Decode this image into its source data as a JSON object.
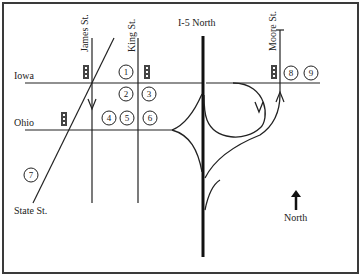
{
  "map": {
    "title": "Street map with I-5 North interchange",
    "streets": {
      "east_west": [
        {
          "name": "Iowa",
          "label": "Iowa"
        },
        {
          "name": "Ohio",
          "label": "Ohio"
        }
      ],
      "north_south": [
        {
          "name": "James St.",
          "label": "James St.",
          "direction": "one-way southbound"
        },
        {
          "name": "King St.",
          "label": "King St."
        },
        {
          "name": "Moore St.",
          "label": "Moore St.",
          "direction": "one-way northbound"
        }
      ],
      "diagonal": [
        {
          "name": "State St.",
          "label": "State St."
        }
      ],
      "highway": {
        "name": "I-5 North",
        "label": "I-5 North"
      }
    },
    "locations": [
      {
        "id": 1,
        "label": "1"
      },
      {
        "id": 2,
        "label": "2"
      },
      {
        "id": 3,
        "label": "3"
      },
      {
        "id": 4,
        "label": "4"
      },
      {
        "id": 5,
        "label": "5"
      },
      {
        "id": 6,
        "label": "6"
      },
      {
        "id": 7,
        "label": "7"
      },
      {
        "id": 8,
        "label": "8"
      },
      {
        "id": 9,
        "label": "9"
      }
    ],
    "traffic_lights": [
      {
        "at": "Iowa & James St."
      },
      {
        "at": "Iowa & King St."
      },
      {
        "at": "Ohio & State St."
      },
      {
        "at": "Iowa & Moore St."
      }
    ],
    "compass": {
      "label": "North",
      "icon": "north-arrow-icon"
    }
  }
}
